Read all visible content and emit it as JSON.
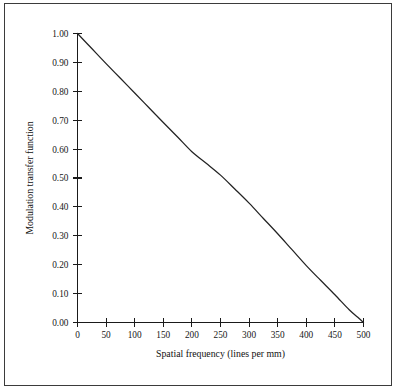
{
  "figure": {
    "background_color": "#ffffff",
    "border_color": "#3b3b3b",
    "curve_color": "#232323",
    "axis_color": "#1a1a1a",
    "text_color": "#161616"
  },
  "chart_data": {
    "type": "line",
    "title": "",
    "subtitle": "",
    "xlabel": "Spatial frequency (lines per mm)",
    "ylabel": "Modulation transfer function",
    "xlim": [
      0,
      500
    ],
    "ylim": [
      0.0,
      1.0
    ],
    "grid": false,
    "legend": null,
    "legend_position": "none",
    "xticks": [
      0,
      50,
      100,
      150,
      200,
      250,
      300,
      350,
      400,
      450,
      500
    ],
    "xtick_labels": [
      "0",
      "50",
      "100",
      "150",
      "200",
      "250",
      "300",
      "350",
      "400",
      "450",
      "500"
    ],
    "yticks": [
      0.0,
      0.1,
      0.2,
      0.3,
      0.4,
      0.5,
      0.6,
      0.7,
      0.8,
      0.9,
      1.0
    ],
    "ytick_labels": [
      "0.00",
      "0.10",
      "0.20",
      "0.30",
      "0.40",
      "0.50",
      "0.60",
      "0.70",
      "0.80",
      "0.90",
      "1.00"
    ],
    "series": [
      {
        "name": "Modulation transfer function",
        "x": [
          0,
          25,
          50,
          75,
          100,
          125,
          150,
          175,
          200,
          225,
          250,
          275,
          300,
          325,
          350,
          375,
          400,
          425,
          450,
          475,
          490,
          500
        ],
        "values": [
          1.0,
          0.948,
          0.896,
          0.845,
          0.794,
          0.743,
          0.692,
          0.642,
          0.591,
          0.551,
          0.51,
          0.462,
          0.413,
          0.36,
          0.307,
          0.252,
          0.197,
          0.146,
          0.096,
          0.044,
          0.018,
          0.0
        ]
      }
    ],
    "annotations": []
  },
  "axis": {
    "x_title": "Spatial frequency (lines per mm)",
    "y_title": "Modulation transfer function"
  }
}
